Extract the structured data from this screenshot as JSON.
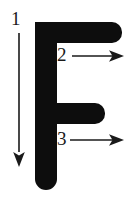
{
  "diagram": {
    "subject_letter": "F",
    "colors": {
      "letter_fill": "#0d0d0d",
      "arrow_stroke": "#1a1a1a",
      "background": "#ffffff",
      "label_text": "#1a1a1a"
    },
    "letter_glyph": {
      "name": "capital-letter-f",
      "character": "F",
      "stem": {
        "x": 35,
        "y": 22,
        "width": 22,
        "height": 168,
        "radius": 11
      },
      "top_arm": {
        "x": 35,
        "y": 22,
        "width": 87,
        "height": 21,
        "radius": 10
      },
      "middle_arm": {
        "x": 35,
        "y": 103,
        "width": 70,
        "height": 21,
        "radius": 10
      }
    },
    "strokes": [
      {
        "number": "1",
        "label": "1",
        "direction": "down",
        "description": "vertical stroke downward",
        "label_x": 11,
        "label_y": 9,
        "line": {
          "x1": 19,
          "y1": 33,
          "x2": 19,
          "y2": 152
        },
        "arrowhead": {
          "x": 19,
          "y": 167
        }
      },
      {
        "number": "2",
        "label": "2",
        "direction": "right",
        "description": "top horizontal stroke to the right",
        "label_x": 57,
        "label_y": 45,
        "line": {
          "x1": 72,
          "y1": 56,
          "x2": 113,
          "y2": 56
        },
        "arrowhead": {
          "x": 124,
          "y": 56
        }
      },
      {
        "number": "3",
        "label": "3",
        "direction": "right",
        "description": "middle horizontal stroke to the right",
        "label_x": 57,
        "label_y": 129,
        "line": {
          "x1": 70,
          "y1": 140,
          "x2": 113,
          "y2": 140
        },
        "arrowhead": {
          "x": 124,
          "y": 140
        }
      }
    ]
  }
}
